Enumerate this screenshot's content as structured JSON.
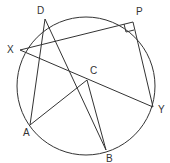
{
  "diagram": {
    "type": "circle-geometry",
    "circle": {
      "cx": 86,
      "cy": 86,
      "r": 69
    },
    "points": {
      "D": {
        "x": 45,
        "y": 19,
        "label": "D",
        "lx": 37,
        "ly": 14
      },
      "P": {
        "x": 133,
        "y": 22,
        "label": "P",
        "lx": 136,
        "ly": 15
      },
      "X": {
        "x": 20,
        "y": 50,
        "label": "X",
        "lx": 7,
        "ly": 53
      },
      "C": {
        "x": 87,
        "y": 80,
        "label": "C",
        "lx": 90,
        "ly": 74
      },
      "A": {
        "x": 30,
        "y": 125,
        "label": "A",
        "lx": 23,
        "ly": 136
      },
      "B": {
        "x": 106,
        "y": 150,
        "label": "B",
        "lx": 106,
        "ly": 162
      },
      "Y": {
        "x": 153,
        "y": 107,
        "label": "Y",
        "lx": 158,
        "ly": 113
      }
    },
    "segments": [
      [
        "D",
        "A"
      ],
      [
        "D",
        "B"
      ],
      [
        "X",
        "P"
      ],
      [
        "X",
        "Y"
      ],
      [
        "P",
        "Y"
      ],
      [
        "A",
        "C"
      ],
      [
        "C",
        "B"
      ]
    ],
    "right_angle_at": "P",
    "stroke_color": "#333333"
  }
}
